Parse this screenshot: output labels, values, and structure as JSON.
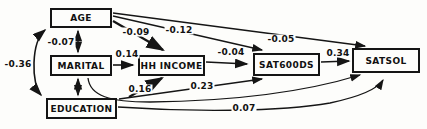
{
  "diagram": {
    "title": "",
    "type": "path-analysis-model",
    "nodes": {
      "age": {
        "label": "AGE"
      },
      "marital": {
        "label": "MARITAL"
      },
      "education": {
        "label": "EDUCATION"
      },
      "hh_income": {
        "label": "HH INCOME"
      },
      "satgoods": {
        "label": "SAT600DS"
      },
      "satsol": {
        "label": "SATSOL"
      }
    },
    "edges": [
      {
        "from": "AGE",
        "to": "MARITAL",
        "kind": "covariance-double-arrow",
        "coefficient": "-0.07"
      },
      {
        "from": "MARITAL",
        "to": "EDUCATION",
        "kind": "covariance-double-arrow",
        "coefficient": ""
      },
      {
        "from": "AGE",
        "to": "EDUCATION",
        "kind": "covariance-double-arrow",
        "coefficient": "-0.36"
      },
      {
        "from": "AGE",
        "to": "HH INCOME",
        "kind": "path-arrow",
        "coefficient": "-0.09"
      },
      {
        "from": "AGE",
        "to": "SAT600DS",
        "kind": "path-arrow",
        "coefficient": "-0.12"
      },
      {
        "from": "AGE",
        "to": "SATSOL",
        "kind": "path-arrow",
        "coefficient": "-0.05"
      },
      {
        "from": "MARITAL",
        "to": "HH INCOME",
        "kind": "path-arrow",
        "coefficient": "0.14"
      },
      {
        "from": "EDUCATION",
        "to": "HH INCOME",
        "kind": "path-arrow",
        "coefficient": "0.16"
      },
      {
        "from": "HH INCOME",
        "to": "SAT600DS",
        "kind": "path-arrow",
        "coefficient": "-0.04"
      },
      {
        "from": "EDUCATION",
        "to": "SAT600DS",
        "kind": "path-arrow",
        "coefficient": "0.23"
      },
      {
        "from": "SAT600DS",
        "to": "SATSOL",
        "kind": "path-arrow",
        "coefficient": "0.34"
      },
      {
        "from": "MARITAL",
        "to": "SATSOL",
        "kind": "path-arrow",
        "coefficient": ""
      },
      {
        "from": "EDUCATION",
        "to": "SATSOL",
        "kind": "path-arrow",
        "coefficient": "0.07"
      }
    ],
    "colors": {
      "ink": "#151515",
      "paper": "#fdfdfb"
    }
  }
}
